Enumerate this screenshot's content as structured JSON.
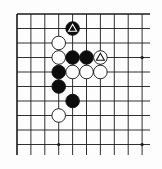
{
  "board": {
    "description": "Go board diagram, top-left corner region",
    "colors": {
      "background": "#fdfdfd",
      "line": "#1a1a1a",
      "black_stone": "#0d0d0d",
      "white_stone": "#ffffff",
      "stone_outline": "#111111"
    },
    "grid": {
      "cols": 10,
      "rows": 10,
      "x0": 17,
      "dx": 13.9,
      "y0": 14,
      "dy": 14.5,
      "line_extend_right": 150,
      "line_extend_bottom": 155,
      "top_edge": true,
      "left_edge": true
    },
    "star_points": [
      {
        "col": 3,
        "row": 3
      },
      {
        "col": 9,
        "row": 3
      },
      {
        "col": 3,
        "row": 9
      },
      {
        "col": 9,
        "row": 9
      }
    ],
    "stones": [
      {
        "color": "black",
        "col": 4,
        "row": 1,
        "marker": "triangle"
      },
      {
        "color": "white",
        "col": 3,
        "row": 2,
        "marker": ""
      },
      {
        "color": "white",
        "col": 3,
        "row": 3,
        "marker": ""
      },
      {
        "color": "black",
        "col": 4,
        "row": 3,
        "marker": ""
      },
      {
        "color": "black",
        "col": 5,
        "row": 3,
        "marker": ""
      },
      {
        "color": "white",
        "col": 6,
        "row": 3,
        "marker": "triangle"
      },
      {
        "color": "black",
        "col": 3,
        "row": 4,
        "marker": ""
      },
      {
        "color": "white",
        "col": 4,
        "row": 4,
        "marker": ""
      },
      {
        "color": "white",
        "col": 5,
        "row": 4,
        "marker": ""
      },
      {
        "color": "white",
        "col": 6,
        "row": 4,
        "marker": ""
      },
      {
        "color": "black",
        "col": 3,
        "row": 5,
        "marker": ""
      },
      {
        "color": "black",
        "col": 4,
        "row": 6,
        "marker": ""
      },
      {
        "color": "white",
        "col": 3,
        "row": 7,
        "marker": ""
      }
    ]
  }
}
